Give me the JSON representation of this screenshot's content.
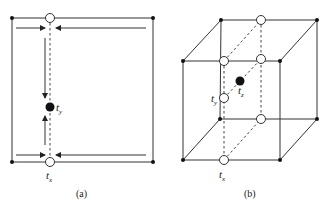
{
  "panels": [
    {
      "id": "a",
      "caption": "(a)",
      "labels": {
        "ty_main": "t",
        "ty_sub": "y",
        "tx_main": "t",
        "tx_sub": "x"
      }
    },
    {
      "id": "b",
      "caption": "(b)",
      "labels": {
        "ty_main": "t",
        "ty_sub": "y",
        "tz_main": "t",
        "tz_sub": "z",
        "tx_main": "t",
        "tx_sub": "x"
      }
    }
  ],
  "colors": {
    "line": "#333333",
    "point": "#111111",
    "background": "#ffffff"
  }
}
